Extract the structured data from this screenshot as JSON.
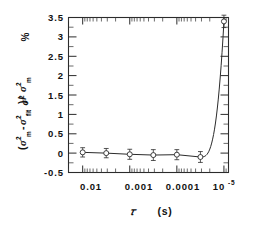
{
  "chart_data": {
    "type": "line",
    "title": "",
    "subtitle": "",
    "xlabel": "τ   (s)",
    "ylabel": "(σ² m -σ² fit)/σ² m",
    "ylabel_unit": "%",
    "xscale": "log-reversed",
    "xlim": [
      0.02,
      8e-06
    ],
    "ylim": [
      -0.5,
      3.5
    ],
    "grid": false,
    "legend": null,
    "x_tick_labels": [
      "0.01",
      "0.001",
      "0.0001",
      "10",
      "-5"
    ],
    "x_major_ticks": [
      0.01,
      0.001,
      0.0001,
      1e-05
    ],
    "y_tick_labels": [
      "3.5",
      "3",
      "2.5",
      "2",
      "1.5",
      "1",
      "0.5",
      "0",
      "-0.5"
    ],
    "y_major_ticks": [
      3.5,
      3,
      2.5,
      2,
      1.5,
      1,
      0.5,
      0,
      -0.5
    ],
    "series": [
      {
        "name": "residual",
        "marker": "open-circle",
        "x": [
          0.01,
          0.00316,
          0.001,
          0.000316,
          0.0001,
          3.16e-05,
          1e-05
        ],
        "y": [
          0.02,
          0.0,
          -0.03,
          -0.05,
          -0.04,
          -0.1,
          3.4
        ],
        "yerr": [
          0.12,
          0.12,
          0.13,
          0.14,
          0.13,
          0.14,
          0.16
        ]
      }
    ],
    "curve_note": "flat near zero from 1e-2 to ~3e-5 then sharp rise to 3.4 at 1e-5"
  },
  "axis": {
    "y_unit_label": "%",
    "x_exponent_base": "10",
    "x_exponent_power": "-5"
  }
}
